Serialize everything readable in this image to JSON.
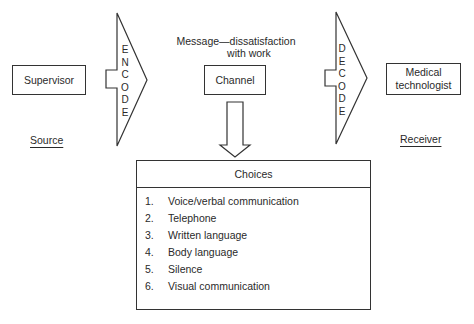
{
  "source": {
    "box_label": "Supervisor",
    "role_label": "Source"
  },
  "encode": {
    "letters": [
      "E",
      "N",
      "C",
      "O",
      "D",
      "E"
    ]
  },
  "message": {
    "line1": "Message—dissatisfaction",
    "line2": "with work"
  },
  "channel": {
    "label": "Channel"
  },
  "decode": {
    "letters": [
      "D",
      "E",
      "C",
      "O",
      "D",
      "E"
    ]
  },
  "receiver": {
    "box_line1": "Medical",
    "box_line2": "technologist",
    "role_label": "Receiver"
  },
  "choices": {
    "title": "Choices",
    "items": [
      {
        "num": "1.",
        "text": "Voice/verbal communication"
      },
      {
        "num": "2.",
        "text": "Telephone"
      },
      {
        "num": "3.",
        "text": "Written language"
      },
      {
        "num": "4.",
        "text": "Body language"
      },
      {
        "num": "5.",
        "text": "Silence"
      },
      {
        "num": "6.",
        "text": "Visual communication"
      }
    ]
  }
}
